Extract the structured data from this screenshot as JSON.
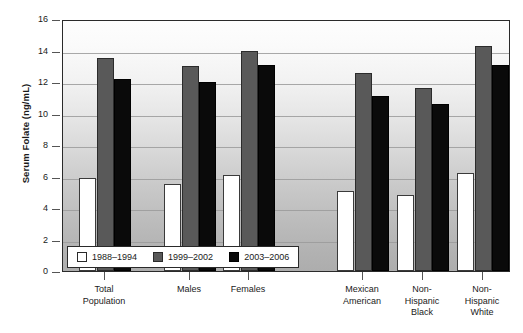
{
  "chart_data": {
    "type": "bar",
    "title": "",
    "xlabel": "",
    "ylabel": "Serum Folate (ng/mL)",
    "ylim": [
      0,
      16
    ],
    "ytick_step": 2,
    "ytick_labels": [
      "16",
      "14",
      "12",
      "10",
      "8",
      "6",
      "4",
      "2",
      "0"
    ],
    "grid": true,
    "legend_position": "bottom-left inside plot",
    "categories": [
      "Total\nPopulation",
      "Males",
      "Females",
      "Mexican\nAmerican",
      "Non-\nHispanic\nBlack",
      "Non-\nHispanic\nWhite"
    ],
    "series": [
      {
        "name": "1988–1994",
        "color": "#ffffff",
        "values": [
          5.9,
          5.5,
          6.1,
          5.1,
          4.8,
          6.2
        ]
      },
      {
        "name": "1999–2002",
        "color": "#595959",
        "values": [
          13.5,
          13.0,
          14.0,
          12.6,
          11.6,
          14.3
        ]
      },
      {
        "name": "2003–2006",
        "color": "#0a0a0a",
        "values": [
          12.2,
          12.0,
          13.1,
          11.1,
          10.6,
          13.1
        ]
      }
    ]
  },
  "axis": {
    "y_title": "Serum Folate (ng/mL)",
    "y_ticks": [
      {
        "label": "16",
        "value": 16
      },
      {
        "label": "14",
        "value": 14
      },
      {
        "label": "12",
        "value": 12
      },
      {
        "label": "10",
        "value": 10
      },
      {
        "label": "8",
        "value": 8
      },
      {
        "label": "6",
        "value": 6
      },
      {
        "label": "4",
        "value": 4
      },
      {
        "label": "2",
        "value": 2
      },
      {
        "label": "0",
        "value": 0
      }
    ]
  },
  "x_categories": [
    {
      "line1": "Total",
      "line2": "Population",
      "line3": ""
    },
    {
      "line1": "Males",
      "line2": "",
      "line3": ""
    },
    {
      "line1": "Females",
      "line2": "",
      "line3": ""
    },
    {
      "line1": "Mexican",
      "line2": "American",
      "line3": ""
    },
    {
      "line1": "Non-",
      "line2": "Hispanic",
      "line3": "Black"
    },
    {
      "line1": "Non-",
      "line2": "Hispanic",
      "line3": "White"
    }
  ],
  "legend": {
    "items": [
      {
        "label": "1988–1994",
        "swatch": "s1988"
      },
      {
        "label": "1999–2002",
        "swatch": "s1999"
      },
      {
        "label": "2003–2006",
        "swatch": "s2003"
      }
    ]
  },
  "colors": {
    "series_1988_1994": "#ffffff",
    "series_1999_2002": "#595959",
    "series_2003_2006": "#0a0a0a",
    "axis": "#2a2a2a",
    "gridline": "#9a9a9a"
  }
}
